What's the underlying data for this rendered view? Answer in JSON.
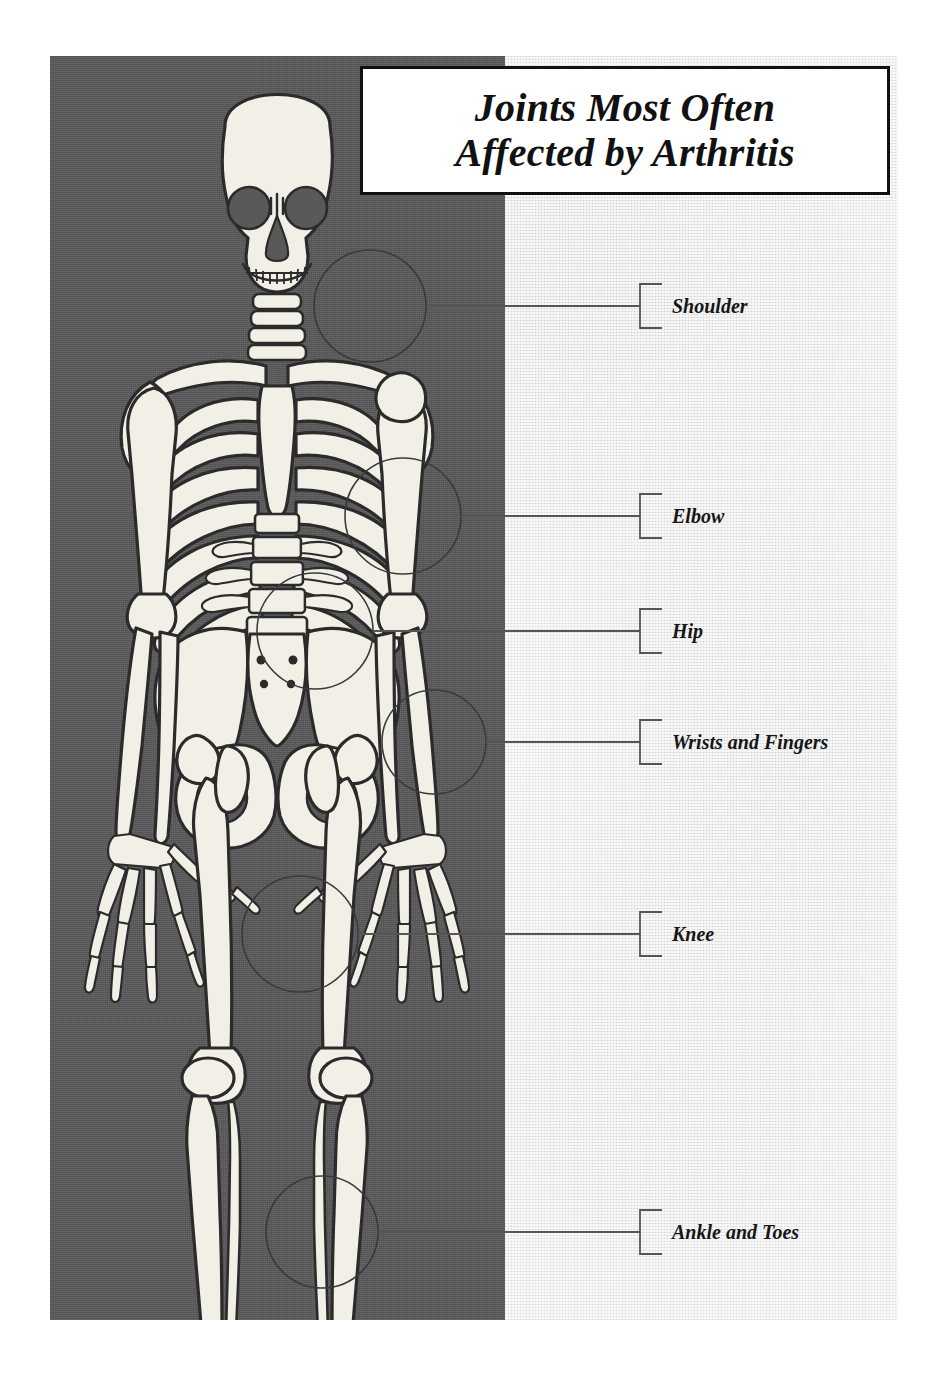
{
  "poster": {
    "title_lines": [
      "Joints Most Often",
      "Affected by Arthritis"
    ],
    "dark_panel_color": "#595959",
    "light_panel_color": "#eeeeee",
    "bone_fill_color": "#f2f0e6",
    "bone_outline_color": "#2b2b2b",
    "marker_circle_color": "#3a3a3a",
    "leader_line_color": "#555555",
    "label_text_color": "#161616"
  },
  "callouts": [
    {
      "id": "shoulder",
      "label": "Shoulder",
      "marker": {
        "cx": 370,
        "cy": 306,
        "r": 56
      },
      "leader_y": 306,
      "leader_from_x": 426,
      "bracket_x": 640,
      "bracket_top": 284,
      "bracket_bottom": 328,
      "text_x": 672
    },
    {
      "id": "elbow",
      "label": "Elbow",
      "marker": {
        "cx": 403,
        "cy": 516,
        "r": 58
      },
      "leader_y": 516,
      "leader_from_x": 461,
      "bracket_x": 640,
      "bracket_top": 494,
      "bracket_bottom": 538,
      "text_x": 672
    },
    {
      "id": "hip",
      "label": "Hip",
      "marker": {
        "cx": 315,
        "cy": 631,
        "r": 58
      },
      "leader_y": 631,
      "leader_from_x": 373,
      "bracket_x": 640,
      "bracket_top": 609,
      "bracket_bottom": 653,
      "text_x": 672
    },
    {
      "id": "wrists-and-fingers",
      "label": "Wrists and Fingers",
      "marker": {
        "cx": 434,
        "cy": 742,
        "r": 52
      },
      "leader_y": 742,
      "leader_from_x": 486,
      "bracket_x": 640,
      "bracket_top": 720,
      "bracket_bottom": 764,
      "text_x": 672
    },
    {
      "id": "knee",
      "label": "Knee",
      "marker": {
        "cx": 300,
        "cy": 934,
        "r": 58
      },
      "leader_y": 934,
      "leader_from_x": 358,
      "bracket_x": 640,
      "bracket_top": 912,
      "bracket_bottom": 956,
      "text_x": 672
    },
    {
      "id": "ankle-and-toes",
      "label": "Ankle and Toes",
      "marker": {
        "cx": 322,
        "cy": 1232,
        "r": 56
      },
      "leader_y": 1232,
      "leader_from_x": 378,
      "bracket_x": 640,
      "bracket_top": 1210,
      "bracket_bottom": 1254,
      "text_x": 672
    }
  ],
  "anatomy": {
    "figure_description": "Anterior view of a full human skeleton",
    "regions": [
      "skull",
      "cervical-spine",
      "clavicles",
      "scapulae",
      "ribcage",
      "sternum",
      "lumbar-spine",
      "pelvis",
      "sacrum",
      "humerus",
      "radius",
      "ulna",
      "carpals",
      "metacarpals",
      "phalanges-hand",
      "femur",
      "patella",
      "tibia",
      "fibula",
      "tarsals",
      "metatarsals",
      "phalanges-foot"
    ]
  }
}
